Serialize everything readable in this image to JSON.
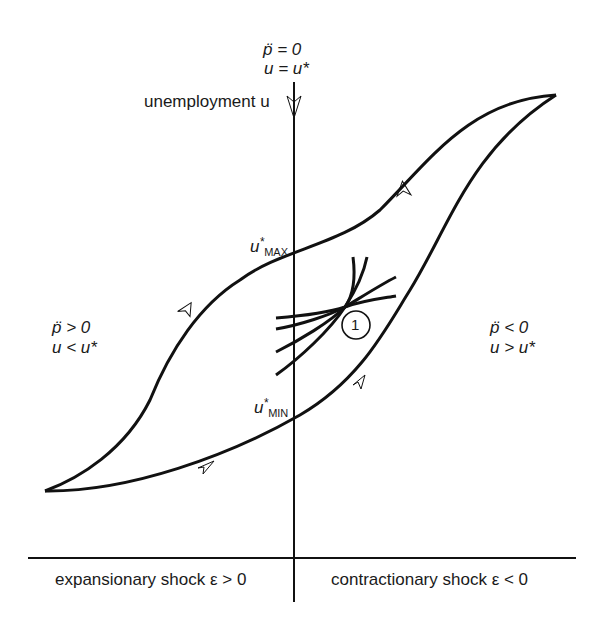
{
  "figure": {
    "type": "hysteresis diagram",
    "vertical_axis": {
      "label": "unemployment u",
      "top_condition_line1": "p̈ = 0",
      "top_condition_line2": "u = u*"
    },
    "horizontal_axis": {
      "left_label": "expansionary shock ε > 0",
      "right_label": "contractionary shock ε < 0"
    },
    "regions": {
      "left": {
        "line1": "p̈ > 0",
        "line2": "u < u*"
      },
      "right": {
        "line1": "p̈ < 0",
        "line2": "u > u*"
      }
    },
    "markers": {
      "u_max": {
        "base": "u",
        "star": "*",
        "sub": "MAX"
      },
      "u_min": {
        "base": "u",
        "star": "*",
        "sub": "MIN"
      },
      "circled_number": "1"
    },
    "colors": {
      "ink": "#111111",
      "background": "#ffffff"
    }
  }
}
